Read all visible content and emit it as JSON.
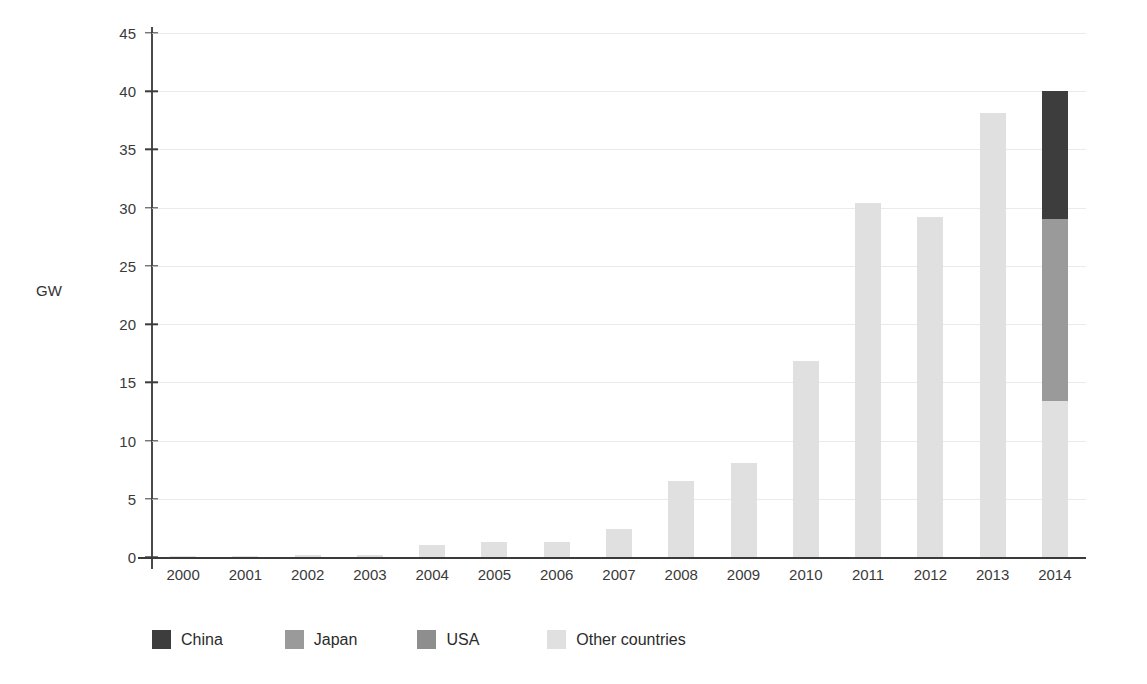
{
  "chart_data": {
    "type": "bar",
    "stacked": true,
    "title": "",
    "subtitle": "",
    "xlabel": "",
    "ylabel": "GW",
    "ylim": [
      0,
      45
    ],
    "ytick_values": [
      0,
      5,
      10,
      15,
      20,
      25,
      30,
      35,
      40,
      45
    ],
    "ytick_labels": [
      "0",
      "5",
      "10",
      "15",
      "20",
      "25",
      "30",
      "35",
      "40",
      "45"
    ],
    "grid": true,
    "legend_position": "bottom",
    "categories": [
      "2000",
      "2001",
      "2002",
      "2003",
      "2004",
      "2005",
      "2006",
      "2007",
      "2008",
      "2009",
      "2010",
      "2011",
      "2012",
      "2013",
      "2014"
    ],
    "series": [
      {
        "name": "Other countries",
        "color": "#e0e0e0",
        "values": [
          0.05,
          0.08,
          0.2,
          0.2,
          1.0,
          1.3,
          1.3,
          2.4,
          6.5,
          8.1,
          16.8,
          30.4,
          29.2,
          38.1,
          13.4
        ]
      },
      {
        "name": "USA",
        "color": "#8e8e8e",
        "values": [
          0,
          0,
          0,
          0,
          0,
          0,
          0,
          0,
          0,
          0,
          0,
          0,
          0,
          0,
          0
        ]
      },
      {
        "name": "Japan",
        "color": "#9a9a9a",
        "values": [
          0,
          0,
          0,
          0,
          0,
          0,
          0,
          0,
          0,
          0,
          0,
          0,
          0,
          0,
          15.6
        ]
      },
      {
        "name": "China",
        "color": "#3d3d3d",
        "values": [
          0,
          0,
          0,
          0,
          0,
          0,
          0,
          0,
          0,
          0,
          0,
          0,
          0,
          0,
          11.0
        ]
      }
    ],
    "totals": [
      0.05,
      0.08,
      0.2,
      0.2,
      1.0,
      1.3,
      1.3,
      2.4,
      6.5,
      8.1,
      16.8,
      30.4,
      29.2,
      38.1,
      40.0
    ]
  },
  "legend": {
    "items": [
      {
        "label": "China",
        "color": "#3d3d3d"
      },
      {
        "label": "Japan",
        "color": "#9a9a9a"
      },
      {
        "label": "USA",
        "color": "#8e8e8e"
      },
      {
        "label": "Other countries",
        "color": "#e0e0e0"
      }
    ]
  },
  "colors": {
    "gridline": "#e9e9ee",
    "axis": "#3a3a3a",
    "text": "#3a3a3a",
    "background": "#ffffff"
  }
}
